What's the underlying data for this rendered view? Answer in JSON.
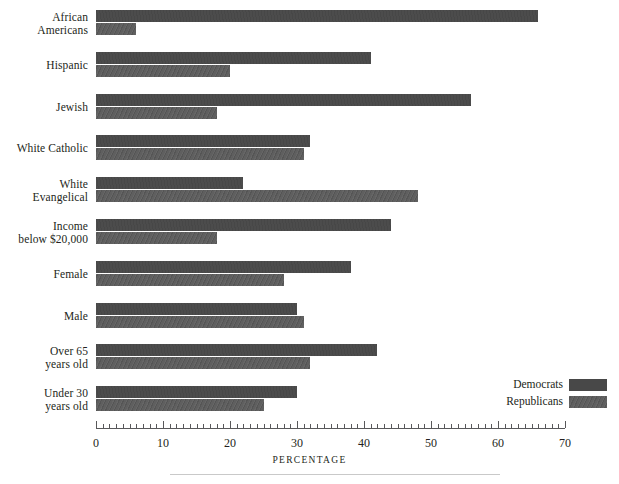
{
  "chart_data": {
    "type": "bar",
    "orientation": "horizontal",
    "title": "",
    "xlabel": "PERCENTAGE",
    "ylabel": "",
    "xlim": [
      0,
      70
    ],
    "xticks": [
      0,
      10,
      20,
      30,
      40,
      50,
      60,
      70
    ],
    "minor_tick_step": 1,
    "grid": false,
    "legend_position": "bottom-right",
    "categories": [
      "African Americans",
      "Hispanic",
      "Jewish",
      "White Catholic",
      "White Evangelical",
      "Income below $20,000",
      "Female",
      "Male",
      "Over 65 years old",
      "Under 30 years old"
    ],
    "category_lines": [
      [
        "African",
        "Americans"
      ],
      [
        "Hispanic"
      ],
      [
        "Jewish"
      ],
      [
        "White Catholic"
      ],
      [
        "White",
        "Evangelical"
      ],
      [
        "Income",
        "below $20,000"
      ],
      [
        "Female"
      ],
      [
        "Male"
      ],
      [
        "Over 65",
        "years old"
      ],
      [
        "Under 30",
        "years old"
      ]
    ],
    "series": [
      {
        "name": "Democrats",
        "color": "#484848",
        "values": [
          66,
          41,
          56,
          32,
          22,
          44,
          38,
          30,
          42,
          30
        ]
      },
      {
        "name": "Republicans",
        "color": "#5a5a5a",
        "values": [
          6,
          20,
          18,
          31,
          48,
          18,
          28,
          31,
          32,
          25
        ]
      }
    ]
  },
  "legend": {
    "items": [
      {
        "label": "Democrats",
        "key": "dem"
      },
      {
        "label": "Republicans",
        "key": "rep"
      }
    ]
  },
  "axis": {
    "title": "PERCENTAGE",
    "tick_labels": [
      "0",
      "10",
      "20",
      "30",
      "40",
      "50",
      "60",
      "70"
    ]
  }
}
